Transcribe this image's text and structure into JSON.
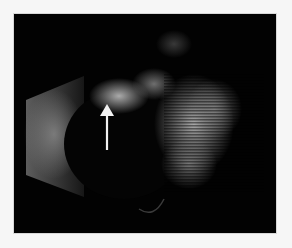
{
  "image": {
    "description": "B-scan ultrasound image with a white arrow pointing at a bright echogenic region",
    "background_color": "#f6f6f6",
    "frame_color": "#020202",
    "annotation": {
      "type": "arrow",
      "color": "#f2f2f2",
      "direction": "up"
    }
  }
}
